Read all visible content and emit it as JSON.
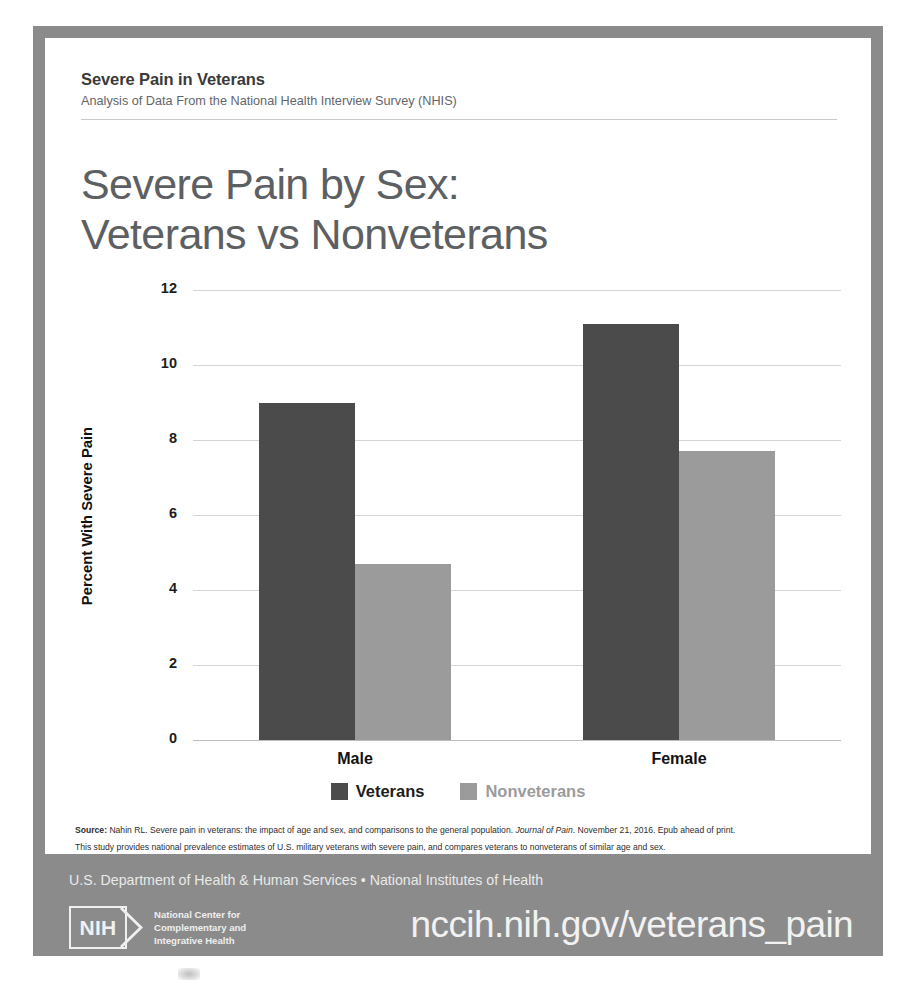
{
  "header": {
    "kicker": "Severe Pain in Veterans",
    "subkicker": "Analysis of Data From the National Health Interview Survey (NHIS)",
    "title_line1": "Severe Pain by Sex:",
    "title_line2": "Veterans vs Nonveterans"
  },
  "chart_data": {
    "type": "bar",
    "title": "Severe Pain by Sex: Veterans vs Nonveterans",
    "subtitle": "Analysis of Data From the National Health Interview Survey (NHIS)",
    "categories": [
      "Male",
      "Female"
    ],
    "series": [
      {
        "name": "Veterans",
        "values": [
          9.0,
          11.1
        ],
        "color": "#4b4b4b"
      },
      {
        "name": "Nonveterans",
        "values": [
          4.7,
          7.7
        ],
        "color": "#9b9b9b"
      }
    ],
    "xlabel": "",
    "ylabel": "Percent With Severe Pain",
    "ylim": [
      0,
      12
    ],
    "yticks": [
      "0",
      "2",
      "4",
      "6",
      "8",
      "10",
      "12"
    ],
    "grid": true,
    "legend_position": "bottom"
  },
  "legend": [
    {
      "label": "Veterans",
      "color": "#4b4b4b"
    },
    {
      "label": "Nonveterans",
      "color": "#9b9b9b"
    }
  ],
  "source": {
    "line1_bold": "Source:",
    "line1_a": " Nahin RL. Severe pain in veterans: the impact of age and sex, and comparisons to the general population. ",
    "line1_italic": "Journal of Pain",
    "line1_b": ". November 21, 2016. Epub ahead of print.",
    "line2": "This study provides national prevalence estimates of U.S. military veterans with severe pain, and compares veterans to nonveterans of similar age and sex."
  },
  "footer": {
    "hhs": "U.S. Department of Health & Human Services • National Institutes of Health",
    "nih_mark": "NIH",
    "nih_name_line1": "National Center for",
    "nih_name_line2": "Complementary and",
    "nih_name_line3": "Integrative Health",
    "url": "nccih.nih.gov/veterans_pain"
  },
  "colors": {
    "poster_bg": "#8b8b8b",
    "panel_bg": "#ffffff",
    "veterans": "#4b4b4b",
    "nonveterans": "#9b9b9b",
    "title_text": "#5d6063"
  }
}
